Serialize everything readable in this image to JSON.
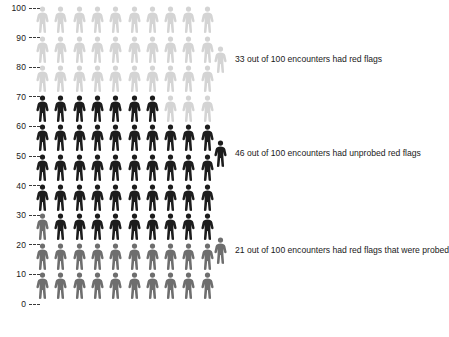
{
  "chart_data": {
    "type": "pictogram",
    "title": "",
    "subtitle": "",
    "xlabel": "",
    "ylabel": "",
    "total_units": 100,
    "unit_symbol": "person",
    "columns_per_row": 10,
    "rows": 10,
    "fill_order": "bottom-up",
    "ylim": [
      0,
      100
    ],
    "grid": false,
    "legend_position": "right",
    "axis_ticks": [
      "100",
      "90",
      "80",
      "70",
      "60",
      "50",
      "40",
      "30",
      "20",
      "10",
      "0"
    ],
    "axis_tick_values": [
      100,
      90,
      80,
      70,
      60,
      50,
      40,
      30,
      20,
      10,
      0
    ],
    "categories": [
      "red flags that were probed",
      "unprobed red flags",
      "had red flags"
    ],
    "values": [
      21,
      46,
      33
    ],
    "series": [
      {
        "name": "red flags that were probed",
        "value": 21,
        "color": "#6e6e6e",
        "range_start": 1,
        "range_end": 21,
        "legend_label": "21 out of 100 encounters had red flags that were probed"
      },
      {
        "name": "unprobed red flags",
        "value": 46,
        "color": "#1c1c1c",
        "range_start": 22,
        "range_end": 67,
        "legend_label": "46 out of 100 encounters had unprobed red flags"
      },
      {
        "name": "had red flags",
        "value": 33,
        "color": "#d4d4d4",
        "range_start": 68,
        "range_end": 100,
        "legend_label": "33 out of 100 encounters had red flags"
      }
    ],
    "row_breakdown": [
      {
        "axis_label": "100",
        "range": "91-100",
        "counts": [
          {
            "color": "#d4d4d4",
            "n": 10
          }
        ]
      },
      {
        "axis_label": "90",
        "range": "81-90",
        "counts": [
          {
            "color": "#d4d4d4",
            "n": 10
          }
        ]
      },
      {
        "axis_label": "80",
        "range": "71-80",
        "counts": [
          {
            "color": "#d4d4d4",
            "n": 10
          }
        ]
      },
      {
        "axis_label": "70",
        "range": "61-70",
        "counts": [
          {
            "color": "#1c1c1c",
            "n": 7
          },
          {
            "color": "#d4d4d4",
            "n": 3
          }
        ]
      },
      {
        "axis_label": "60",
        "range": "51-60",
        "counts": [
          {
            "color": "#1c1c1c",
            "n": 10
          }
        ]
      },
      {
        "axis_label": "50",
        "range": "41-50",
        "counts": [
          {
            "color": "#1c1c1c",
            "n": 10
          }
        ]
      },
      {
        "axis_label": "40",
        "range": "31-40",
        "counts": [
          {
            "color": "#1c1c1c",
            "n": 10
          }
        ]
      },
      {
        "axis_label": "30",
        "range": "21-30",
        "counts": [
          {
            "color": "#6e6e6e",
            "n": 1
          },
          {
            "color": "#1c1c1c",
            "n": 9
          }
        ]
      },
      {
        "axis_label": "20",
        "range": "11-20",
        "counts": [
          {
            "color": "#6e6e6e",
            "n": 10
          }
        ]
      },
      {
        "axis_label": "10",
        "range": "1-10",
        "counts": [
          {
            "color": "#6e6e6e",
            "n": 10
          }
        ]
      }
    ]
  },
  "colors": {
    "light_gray": "#d4d4d4",
    "dark": "#1c1c1c",
    "medium_gray": "#6e6e6e",
    "text": "#1a1a1a",
    "background": "#ffffff"
  },
  "legend": [
    {
      "text": "33 out of 100 encounters had red flags",
      "color": "#d4d4d4",
      "value": 33,
      "icon": "person-icon"
    },
    {
      "text": "46 out of 100 encounters had unprobed red flags",
      "color": "#1c1c1c",
      "value": 46,
      "icon": "person-icon"
    },
    {
      "text": "21 out of 100 encounters had red flags that were probed",
      "color": "#6e6e6e",
      "value": 21,
      "icon": "person-icon"
    }
  ]
}
